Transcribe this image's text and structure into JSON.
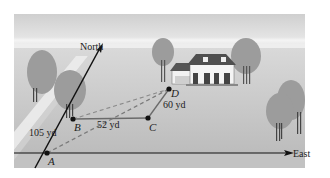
{
  "diagram": {
    "directions": {
      "north": "North",
      "east": "East"
    },
    "points": [
      {
        "id": "A",
        "label": "A",
        "x": 47,
        "y": 153
      },
      {
        "id": "B",
        "label": "B",
        "x": 73,
        "y": 119
      },
      {
        "id": "C",
        "label": "C",
        "x": 148,
        "y": 118
      },
      {
        "id": "D",
        "label": "D",
        "x": 169,
        "y": 89
      }
    ],
    "distances": {
      "ab": "105 yd",
      "bc": "52 yd",
      "cd": "60 yd"
    },
    "colors": {
      "sky_top": "#d8d8d8",
      "ground": "#bdbdbd",
      "road": "#e6e6e6",
      "tree": "#9a9a9a",
      "line": "#111111",
      "path": "#777777",
      "dashed": "#7a7a7a"
    }
  }
}
